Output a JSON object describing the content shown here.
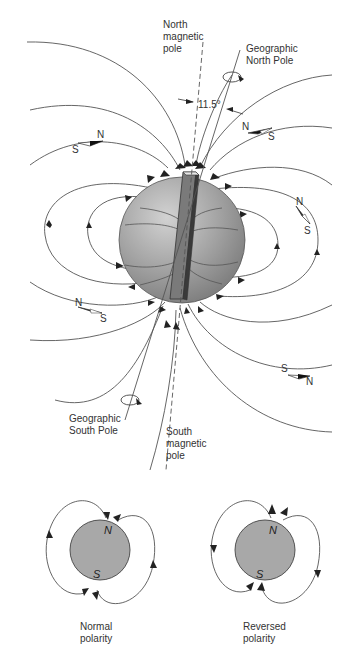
{
  "main_diagram": {
    "labels": {
      "north_magnetic_pole": [
        "North",
        "magnetic",
        "pole"
      ],
      "geographic_north_pole": [
        "Geographic",
        "North Pole"
      ],
      "geographic_south_pole": [
        "Geographic",
        "South Pole"
      ],
      "south_magnetic_pole": [
        "South",
        "magnetic",
        "pole"
      ],
      "angle": "11.5°"
    },
    "compasses": [
      {
        "n": "N",
        "s": "S",
        "position": "upper-left"
      },
      {
        "n": "N",
        "s": "S",
        "position": "upper-right"
      },
      {
        "n": "N",
        "s": "S",
        "position": "right"
      },
      {
        "n": "N",
        "s": "S",
        "position": "lower-left"
      },
      {
        "n": "N",
        "s": "S",
        "position": "lower-right"
      }
    ],
    "colors": {
      "globe": "#9a9a9a",
      "bar_magnet": "#6e6e6e",
      "lines": "#555555"
    }
  },
  "polarity_diagrams": [
    {
      "north": "N",
      "south": "S",
      "caption": [
        "Normal",
        "polarity"
      ]
    },
    {
      "north": "N",
      "south": "S",
      "caption": [
        "Reversed",
        "polarity"
      ]
    }
  ]
}
